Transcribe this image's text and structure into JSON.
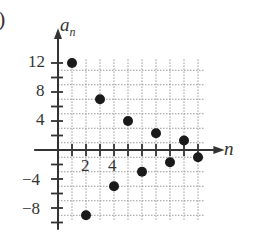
{
  "panel_label": ")",
  "chart_data": {
    "type": "scatter",
    "title": "",
    "xlabel": "n",
    "ylabel": "a_n",
    "x": [
      1,
      2,
      3,
      4,
      5,
      6,
      7,
      8,
      9,
      10
    ],
    "values": [
      12,
      -9,
      7,
      -5,
      4,
      -3,
      2.3,
      -1.7,
      1.3,
      -1
    ],
    "x_ticks": [
      2,
      4
    ],
    "y_ticks": [
      12,
      8,
      4,
      -4,
      -8
    ],
    "xlim": [
      0,
      11
    ],
    "ylim": [
      -10,
      14
    ],
    "grid": true,
    "legend": null
  },
  "axes": {
    "x_label": "n",
    "y_label_main": "a",
    "y_label_sub": "n",
    "x_tick_labels": [
      "2",
      "4"
    ],
    "y_tick_labels": [
      "12",
      "8",
      "4",
      "−4",
      "−8"
    ]
  }
}
